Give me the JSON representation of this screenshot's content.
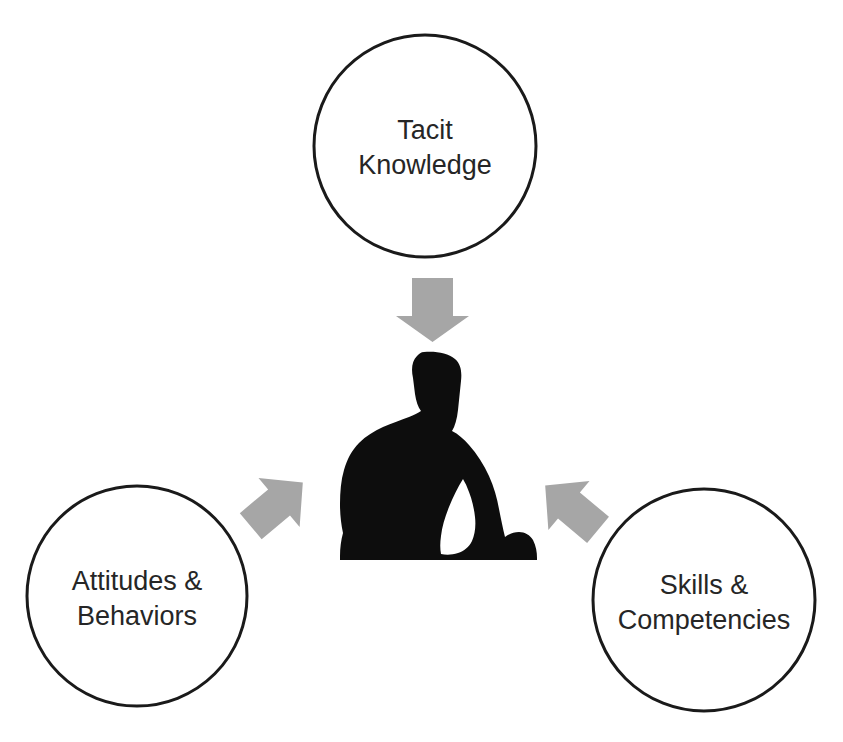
{
  "diagram": {
    "background_color": "#ffffff",
    "circle_stroke_color": "#1a1a1a",
    "text_color": "#262626",
    "arrow_color": "#a6a6a6",
    "figure_color": "#0d0d0d",
    "nodes": [
      {
        "id": "tacit-knowledge",
        "line1": "Tacit",
        "line2": "Knowledge",
        "cx": 425,
        "cy": 146,
        "r": 111
      },
      {
        "id": "attitudes-behaviors",
        "line1": "Attitudes &",
        "line2": "Behaviors",
        "cx": 137,
        "cy": 596,
        "r": 110
      },
      {
        "id": "skills-competencies",
        "line1": "Skills &",
        "line2": "Competencies",
        "cx": 704,
        "cy": 600,
        "r": 111
      }
    ],
    "arrows": [
      {
        "id": "arrow-top-down",
        "direction": "down",
        "from": "tacit-knowledge",
        "to": "person-figure"
      },
      {
        "id": "arrow-left-up-right",
        "direction": "up-right",
        "from": "attitudes-behaviors",
        "to": "person-figure"
      },
      {
        "id": "arrow-right-up-left",
        "direction": "up-left",
        "from": "skills-competencies",
        "to": "person-figure"
      }
    ],
    "center_figure": {
      "id": "person-figure",
      "label": "person-silhouette"
    }
  }
}
